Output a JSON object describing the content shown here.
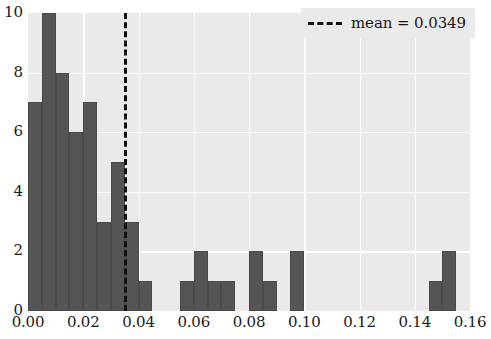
{
  "chart_data": {
    "type": "bar",
    "title": "",
    "xlabel": "",
    "ylabel": "",
    "xlim": [
      0.0,
      0.16
    ],
    "ylim": [
      0,
      10
    ],
    "grid": true,
    "bar_color": "#555555",
    "plot_background": "#eaeaea",
    "figure_background": "#ffffff",
    "bin_width": 0.005,
    "xticks": [
      "0.00",
      "0.02",
      "0.04",
      "0.06",
      "0.08",
      "0.10",
      "0.12",
      "0.14",
      "0.16"
    ],
    "xtick_values": [
      0.0,
      0.02,
      0.04,
      0.06,
      0.08,
      0.1,
      0.12,
      0.14,
      0.16
    ],
    "yticks": [
      "0",
      "2",
      "4",
      "6",
      "8",
      "10"
    ],
    "ytick_values": [
      0,
      2,
      4,
      6,
      8,
      10
    ],
    "bins": [
      {
        "left": 0.0,
        "right": 0.005,
        "count": 7
      },
      {
        "left": 0.005,
        "right": 0.01,
        "count": 10
      },
      {
        "left": 0.01,
        "right": 0.015,
        "count": 8
      },
      {
        "left": 0.015,
        "right": 0.02,
        "count": 6
      },
      {
        "left": 0.02,
        "right": 0.025,
        "count": 7
      },
      {
        "left": 0.025,
        "right": 0.03,
        "count": 3
      },
      {
        "left": 0.03,
        "right": 0.035,
        "count": 5
      },
      {
        "left": 0.035,
        "right": 0.04,
        "count": 3
      },
      {
        "left": 0.04,
        "right": 0.045,
        "count": 1
      },
      {
        "left": 0.045,
        "right": 0.05,
        "count": 0
      },
      {
        "left": 0.05,
        "right": 0.055,
        "count": 0
      },
      {
        "left": 0.055,
        "right": 0.06,
        "count": 1
      },
      {
        "left": 0.06,
        "right": 0.065,
        "count": 2
      },
      {
        "left": 0.065,
        "right": 0.07,
        "count": 1
      },
      {
        "left": 0.07,
        "right": 0.075,
        "count": 1
      },
      {
        "left": 0.075,
        "right": 0.08,
        "count": 0
      },
      {
        "left": 0.08,
        "right": 0.085,
        "count": 2
      },
      {
        "left": 0.085,
        "right": 0.09,
        "count": 1
      },
      {
        "left": 0.09,
        "right": 0.095,
        "count": 0
      },
      {
        "left": 0.095,
        "right": 0.1,
        "count": 2
      },
      {
        "left": 0.1,
        "right": 0.105,
        "count": 0
      },
      {
        "left": 0.105,
        "right": 0.11,
        "count": 0
      },
      {
        "left": 0.11,
        "right": 0.115,
        "count": 0
      },
      {
        "left": 0.115,
        "right": 0.12,
        "count": 0
      },
      {
        "left": 0.12,
        "right": 0.125,
        "count": 0
      },
      {
        "left": 0.125,
        "right": 0.13,
        "count": 0
      },
      {
        "left": 0.13,
        "right": 0.135,
        "count": 0
      },
      {
        "left": 0.135,
        "right": 0.14,
        "count": 0
      },
      {
        "left": 0.14,
        "right": 0.145,
        "count": 0
      },
      {
        "left": 0.145,
        "right": 0.15,
        "count": 1
      },
      {
        "left": 0.15,
        "right": 0.155,
        "count": 2
      }
    ],
    "annotations": [
      {
        "name": "mean-line",
        "type": "vline",
        "value": 0.0349,
        "style": "dashed",
        "color": "#111111"
      }
    ],
    "legend": {
      "position": "upper right",
      "entries": [
        {
          "label": "mean = 0.0349",
          "style": "dashed",
          "color": "#111111"
        }
      ]
    }
  }
}
